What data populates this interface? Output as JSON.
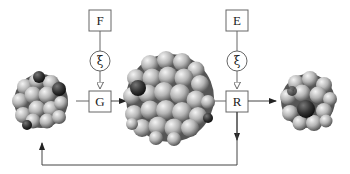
{
  "diagram": {
    "nodes": {
      "input_top_left": {
        "label": "F"
      },
      "input_top_right": {
        "label": "E"
      },
      "noise_left": {
        "label": "ξ"
      },
      "noise_right": {
        "label": "ξ"
      },
      "operator_left": {
        "label": "G"
      },
      "operator_right": {
        "label": "R"
      }
    },
    "clusters": [
      {
        "name": "small-cluster-input",
        "description": "small particle cluster with dark spheres"
      },
      {
        "name": "large-cluster-generated",
        "description": "large spherical particle cluster"
      },
      {
        "name": "small-cluster-output",
        "description": "small particle cluster with dark core"
      }
    ],
    "edges": [
      {
        "from": "F",
        "to": "ξ (left)"
      },
      {
        "from": "ξ (left)",
        "to": "G"
      },
      {
        "from": "small-cluster-input",
        "to": "G"
      },
      {
        "from": "G",
        "to": "large-cluster-generated"
      },
      {
        "from": "E",
        "to": "ξ (right)"
      },
      {
        "from": "ξ (right)",
        "to": "R"
      },
      {
        "from": "large-cluster-generated",
        "to": "R"
      },
      {
        "from": "R",
        "to": "small-cluster-output"
      },
      {
        "from": "R",
        "to": "small-cluster-input",
        "type": "feedback-loop"
      }
    ],
    "colors": {
      "line": "#444444",
      "sphere_light": "#e6e6e6",
      "sphere_mid": "#a8a8a8",
      "sphere_dark": "#3a3a3a"
    }
  }
}
